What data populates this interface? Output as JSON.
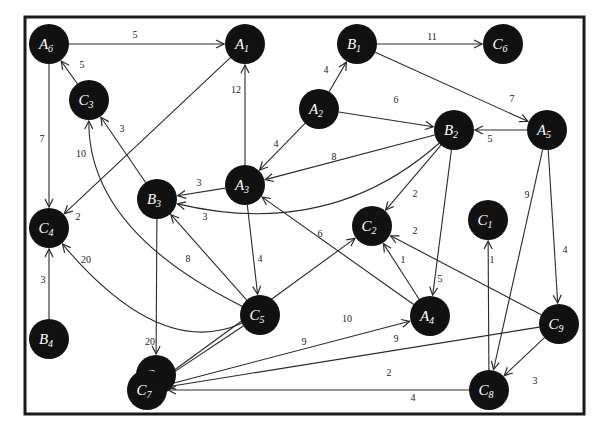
{
  "diagram": {
    "type": "directed weighted graph",
    "colors": {
      "node_fill": "#111111",
      "node_text": "#ffffff",
      "edge": "#2a2a2a",
      "frame": "#1a1a1a",
      "background": "#ffffff"
    },
    "nodes": [
      {
        "id": "A6",
        "letter": "A",
        "sub": "6",
        "x": 49,
        "y": 44
      },
      {
        "id": "A1",
        "letter": "A",
        "sub": "1",
        "x": 245,
        "y": 44
      },
      {
        "id": "B1",
        "letter": "B",
        "sub": "1",
        "x": 357,
        "y": 44
      },
      {
        "id": "C6",
        "letter": "C",
        "sub": "6",
        "x": 503,
        "y": 44
      },
      {
        "id": "C3",
        "letter": "C",
        "sub": "3",
        "x": 89,
        "y": 100
      },
      {
        "id": "A2",
        "letter": "A",
        "sub": "2",
        "x": 319,
        "y": 109
      },
      {
        "id": "B2",
        "letter": "B",
        "sub": "2",
        "x": 454,
        "y": 130
      },
      {
        "id": "A5",
        "letter": "A",
        "sub": "5",
        "x": 547,
        "y": 130
      },
      {
        "id": "A3",
        "letter": "A",
        "sub": "3",
        "x": 245,
        "y": 185
      },
      {
        "id": "B3",
        "letter": "B",
        "sub": "3",
        "x": 157,
        "y": 199
      },
      {
        "id": "C4",
        "letter": "C",
        "sub": "4",
        "x": 49,
        "y": 228
      },
      {
        "id": "C2",
        "letter": "C",
        "sub": "2",
        "x": 372,
        "y": 226
      },
      {
        "id": "C1",
        "letter": "C",
        "sub": "1",
        "x": 488,
        "y": 220
      },
      {
        "id": "C5",
        "letter": "C",
        "sub": "5",
        "x": 260,
        "y": 315
      },
      {
        "id": "A4",
        "letter": "A",
        "sub": "4",
        "x": 430,
        "y": 316
      },
      {
        "id": "C9",
        "letter": "C",
        "sub": "9",
        "x": 559,
        "y": 324
      },
      {
        "id": "B4",
        "letter": "B",
        "sub": "4",
        "x": 49,
        "y": 339
      },
      {
        "id": "B5",
        "letter": "B",
        "sub": "5",
        "x": 156,
        "y": 375
      },
      {
        "id": "C7",
        "letter": "C",
        "sub": "7",
        "x": 147,
        "y": 390
      },
      {
        "id": "C8",
        "letter": "C",
        "sub": "8",
        "x": 489,
        "y": 390
      }
    ],
    "edges": [
      {
        "from": "A6",
        "to": "A1",
        "weight": "5",
        "lx": 135,
        "ly": 38
      },
      {
        "from": "C3",
        "to": "A6",
        "weight": "5",
        "lx": 82,
        "ly": 68
      },
      {
        "from": "A6",
        "to": "C4",
        "weight": "7",
        "lx": 42,
        "ly": 142
      },
      {
        "from": "A1",
        "to": "C4",
        "weight": "2",
        "lx": 78,
        "ly": 220
      },
      {
        "from": "A3",
        "to": "A1",
        "weight": "12",
        "lx": 236,
        "ly": 93
      },
      {
        "from": "A2",
        "to": "B1",
        "weight": "4",
        "lx": 326,
        "ly": 73
      },
      {
        "from": "B1",
        "to": "C6",
        "weight": "11",
        "lx": 432,
        "ly": 40
      },
      {
        "from": "B1",
        "to": "A5",
        "weight": "7",
        "lx": 512,
        "ly": 102
      },
      {
        "from": "A2",
        "to": "B2",
        "weight": "6",
        "lx": 396,
        "ly": 103
      },
      {
        "from": "A5",
        "to": "B2",
        "weight": "5",
        "lx": 490,
        "ly": 142
      },
      {
        "from": "A2",
        "to": "A3",
        "weight": "4",
        "lx": 276,
        "ly": 147
      },
      {
        "from": "B2",
        "to": "A3",
        "weight": "8",
        "lx": 334,
        "ly": 160
      },
      {
        "from": "B2",
        "to": "B3",
        "weight": "3",
        "lx": 205,
        "ly": 220
      },
      {
        "from": "B2",
        "to": "C2",
        "weight": "2",
        "lx": 415,
        "ly": 197
      },
      {
        "from": "B2",
        "to": "A4",
        "weight": "5",
        "lx": 440,
        "ly": 282
      },
      {
        "from": "A3",
        "to": "B3",
        "weight": "3",
        "lx": 199,
        "ly": 186
      },
      {
        "from": "B3",
        "to": "C3",
        "weight": "3",
        "lx": 122,
        "ly": 132
      },
      {
        "from": "C5",
        "to": "C3",
        "weight": "10",
        "lx": 81,
        "ly": 157
      },
      {
        "from": "A3",
        "to": "C5",
        "weight": "4",
        "lx": 260,
        "ly": 262
      },
      {
        "from": "C5",
        "to": "B3",
        "weight": "8",
        "lx": 188,
        "ly": 262
      },
      {
        "from": "C5",
        "to": "C4",
        "weight": "20",
        "lx": 86,
        "ly": 263
      },
      {
        "from": "B4",
        "to": "C4",
        "weight": "3",
        "lx": 43,
        "ly": 283
      },
      {
        "from": "B3",
        "to": "B5",
        "weight": "20",
        "lx": 150,
        "ly": 345
      },
      {
        "from": "C5",
        "to": "C7",
        "weight": "9",
        "lx": 304,
        "ly": 345
      },
      {
        "from": "A4",
        "to": "A3",
        "weight": "6",
        "lx": 320,
        "ly": 237
      },
      {
        "from": "A4",
        "to": "C2",
        "weight": "1",
        "lx": 403,
        "ly": 263
      },
      {
        "from": "C7",
        "to": "C2",
        "weight": "10",
        "lx": 347,
        "ly": 322
      },
      {
        "from": "C7",
        "to": "A4",
        "weight": "9",
        "lx": 396,
        "ly": 342
      },
      {
        "from": "C9",
        "to": "C2",
        "weight": "2",
        "lx": 415,
        "ly": 234
      },
      {
        "from": "C8",
        "to": "C1",
        "weight": "1",
        "lx": 492,
        "ly": 263
      },
      {
        "from": "A5",
        "to": "C8",
        "weight": "9",
        "lx": 527,
        "ly": 198
      },
      {
        "from": "A5",
        "to": "C9",
        "weight": "4",
        "lx": 565,
        "ly": 253
      },
      {
        "from": "C9",
        "to": "C7",
        "weight": "2",
        "lx": 389,
        "ly": 376
      },
      {
        "from": "C9",
        "to": "C8",
        "weight": "3",
        "lx": 535,
        "ly": 384
      },
      {
        "from": "C8",
        "to": "C7",
        "weight": "4",
        "lx": 413,
        "ly": 401
      }
    ]
  }
}
